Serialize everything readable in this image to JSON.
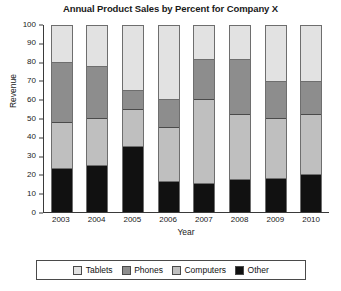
{
  "chart_data": {
    "type": "bar",
    "subtype": "stacked-bar-100-percent",
    "title": "Annual Product Sales by Percent for Company X",
    "xlabel": "Year",
    "ylabel": "Revenue",
    "categories": [
      "2003",
      "2004",
      "2005",
      "2006",
      "2007",
      "2008",
      "2009",
      "2010"
    ],
    "ylim": [
      0,
      100
    ],
    "yticks": [
      0,
      10,
      20,
      30,
      40,
      50,
      60,
      70,
      80,
      90,
      100
    ],
    "grid": false,
    "legend_position": "bottom",
    "stack_order_bottom_to_top": [
      "Other",
      "Computers",
      "Phones",
      "Tablets"
    ],
    "series": [
      {
        "name": "Other",
        "color": "#111111",
        "values": [
          23,
          25,
          35,
          16,
          15,
          17,
          18,
          20
        ],
        "cumulative_tops": [
          23,
          25,
          35,
          16,
          15,
          17,
          18,
          20
        ]
      },
      {
        "name": "Computers",
        "color": "#bfbfbf",
        "values": [
          25,
          25,
          20,
          29,
          45,
          35,
          32,
          32
        ],
        "cumulative_tops": [
          48,
          50,
          55,
          45,
          60,
          52,
          50,
          52
        ]
      },
      {
        "name": "Phones",
        "color": "#8d8d8d",
        "values": [
          32,
          28,
          10,
          15,
          22,
          30,
          20,
          18
        ],
        "cumulative_tops": [
          80,
          78,
          65,
          60,
          82,
          82,
          70,
          70
        ]
      },
      {
        "name": "Tablets",
        "color": "#e2e2e2",
        "values": [
          20,
          22,
          35,
          40,
          18,
          18,
          30,
          30
        ],
        "cumulative_tops": [
          100,
          100,
          100,
          100,
          100,
          100,
          100,
          100
        ]
      }
    ]
  },
  "legend": {
    "items": [
      {
        "label": "Tablets",
        "color": "#e2e2e2"
      },
      {
        "label": "Phones",
        "color": "#8d8d8d"
      },
      {
        "label": "Computers",
        "color": "#bfbfbf"
      },
      {
        "label": "Other",
        "color": "#111111"
      }
    ]
  }
}
